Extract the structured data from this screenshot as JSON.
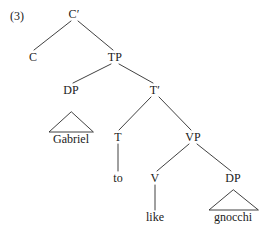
{
  "figure": {
    "example_number": "(3)",
    "background_color": "#ffffff",
    "line_color": "#2b2b2b",
    "text_color": "#1a1a1a",
    "width": 267,
    "height": 234
  },
  "tree": {
    "nodes": [
      {
        "id": "cbar",
        "label": "C′",
        "x": 74,
        "y": 14,
        "kind": "nonterminal"
      },
      {
        "id": "c",
        "label": "C",
        "x": 33,
        "y": 57,
        "kind": "nonterminal"
      },
      {
        "id": "tp",
        "label": "TP",
        "x": 115,
        "y": 57,
        "kind": "nonterminal"
      },
      {
        "id": "dp-subj",
        "label": "DP",
        "x": 71,
        "y": 90,
        "kind": "nonterminal"
      },
      {
        "id": "tbar",
        "label": "T′",
        "x": 155,
        "y": 90,
        "kind": "nonterminal"
      },
      {
        "id": "t",
        "label": "T",
        "x": 118,
        "y": 137,
        "kind": "nonterminal"
      },
      {
        "id": "vp",
        "label": "VP",
        "x": 193,
        "y": 137,
        "kind": "nonterminal"
      },
      {
        "id": "v",
        "label": "V",
        "x": 155,
        "y": 178,
        "kind": "nonterminal"
      },
      {
        "id": "dp-obj",
        "label": "DP",
        "x": 233,
        "y": 178,
        "kind": "nonterminal"
      }
    ],
    "leaves": [
      {
        "id": "gabriel",
        "label": "Gabriel",
        "x": 71,
        "y": 139,
        "parent": "dp-subj",
        "connector": "triangle"
      },
      {
        "id": "to",
        "label": "to",
        "x": 118,
        "y": 178,
        "parent": "t",
        "connector": "line"
      },
      {
        "id": "like",
        "label": "like",
        "x": 155,
        "y": 217,
        "parent": "v",
        "connector": "line"
      },
      {
        "id": "gnocchi",
        "label": "gnocchi",
        "x": 233,
        "y": 217,
        "parent": "dp-obj",
        "connector": "triangle"
      }
    ],
    "branches": [
      {
        "from": "cbar",
        "to": "c",
        "x1": 71,
        "y1": 21,
        "x2": 34,
        "y2": 50
      },
      {
        "from": "cbar",
        "to": "tp",
        "x1": 78,
        "y1": 21,
        "x2": 113,
        "y2": 50
      },
      {
        "from": "tp",
        "to": "dp-subj",
        "x1": 111,
        "y1": 64,
        "x2": 73,
        "y2": 83
      },
      {
        "from": "tp",
        "to": "tbar",
        "x1": 119,
        "y1": 64,
        "x2": 153,
        "y2": 83
      },
      {
        "from": "tbar",
        "to": "t",
        "x1": 151,
        "y1": 97,
        "x2": 119,
        "y2": 130
      },
      {
        "from": "tbar",
        "to": "vp",
        "x1": 159,
        "y1": 97,
        "x2": 191,
        "y2": 130
      },
      {
        "from": "t",
        "to": "to",
        "x1": 118,
        "y1": 144,
        "x2": 118,
        "y2": 171
      },
      {
        "from": "vp",
        "to": "v",
        "x1": 189,
        "y1": 144,
        "x2": 157,
        "y2": 171
      },
      {
        "from": "vp",
        "to": "dp-obj",
        "x1": 197,
        "y1": 144,
        "x2": 231,
        "y2": 171
      },
      {
        "from": "v",
        "to": "like",
        "x1": 155,
        "y1": 185,
        "x2": 155,
        "y2": 210
      }
    ],
    "triangles": [
      {
        "for": "gabriel",
        "apex_x": 71,
        "apex_y": 112,
        "left_x": 49,
        "right_x": 93,
        "base_y": 132
      },
      {
        "for": "gnocchi",
        "apex_x": 233,
        "apex_y": 190,
        "left_x": 209,
        "right_x": 258,
        "base_y": 210
      }
    ]
  }
}
